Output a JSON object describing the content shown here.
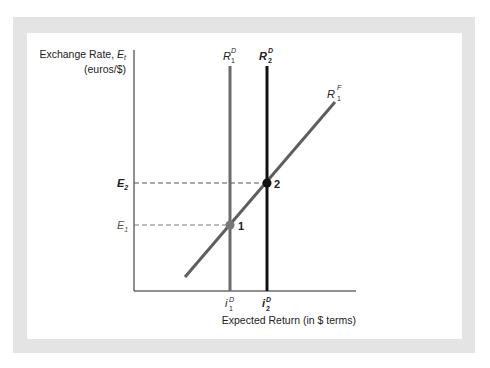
{
  "figure": {
    "y_axis_label": "Exchange Rate, ",
    "y_axis_var": "E",
    "y_axis_var_sub": "t",
    "y_axis_units": "(euros/$)",
    "x_axis_label": "Expected Return (in $ terms)",
    "curves": {
      "r1d": {
        "base": "R",
        "sup": "D",
        "sub": "1"
      },
      "r2d": {
        "base": "R",
        "sup": "D",
        "sub": "2"
      },
      "r1f": {
        "base": "R",
        "sup": "F",
        "sub": "1"
      }
    },
    "y_ticks": {
      "e2": {
        "base": "E",
        "sub": "2"
      },
      "e1": {
        "base": "E",
        "sub": "1"
      }
    },
    "x_ticks": {
      "i1d": {
        "base": "i",
        "sup": "D",
        "sub": "1"
      },
      "i2d": {
        "base": "i",
        "sup": "D",
        "sub": "2"
      }
    },
    "points": {
      "p1": "1",
      "p2": "2"
    },
    "colors": {
      "frame": "#e4e4e4",
      "r1d_line": "#6b6b6b",
      "r2d_line": "#111111",
      "r1f_line": "#5e5e5e",
      "axis": "#222222",
      "dash": "#555555"
    }
  }
}
